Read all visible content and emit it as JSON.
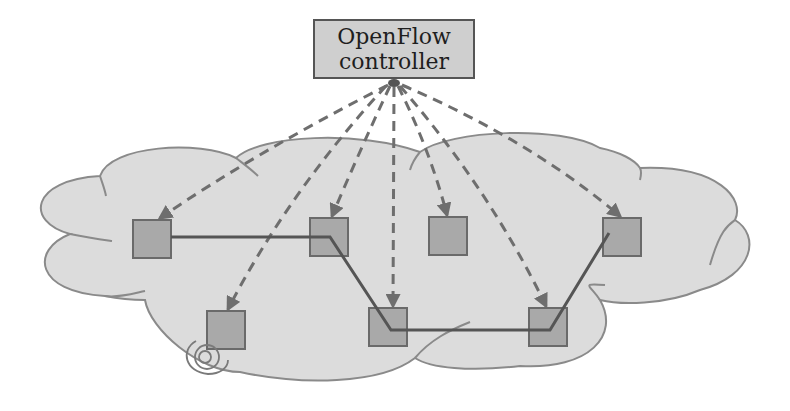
{
  "controller": {
    "line1": "OpenFlow",
    "line2": "controller",
    "fill": "#cfcfcf",
    "stroke": "#555555"
  },
  "colors": {
    "cloud_fill": "#dcdcdc",
    "cloud_stroke": "#8a8a8a",
    "switch_fill": "#a9a9a9",
    "switch_stroke": "#6a6a6a",
    "control_link": "#6e6e6e",
    "data_link": "#555555"
  },
  "switches": [
    {
      "id": "s1",
      "x": 133,
      "y": 220
    },
    {
      "id": "s2",
      "x": 310,
      "y": 218
    },
    {
      "id": "s3",
      "x": 429,
      "y": 217
    },
    {
      "id": "s4",
      "x": 603,
      "y": 218
    },
    {
      "id": "s5",
      "x": 207,
      "y": 311
    },
    {
      "id": "s6",
      "x": 369,
      "y": 308
    },
    {
      "id": "s7",
      "x": 529,
      "y": 308
    }
  ],
  "control_links": [
    "s1",
    "s2",
    "s3",
    "s4",
    "s5",
    "s6",
    "s7"
  ],
  "data_path": [
    "s1",
    "s2",
    "s6",
    "s7",
    "s4"
  ],
  "host_icon": "wireless-antenna-icon"
}
